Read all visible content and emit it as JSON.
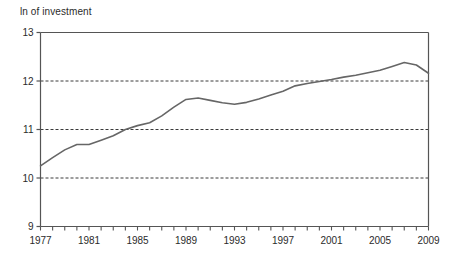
{
  "chart_data": {
    "type": "line",
    "title": "ln of investment",
    "xlabel": "",
    "ylabel": "",
    "ylim": [
      9,
      13
    ],
    "xlim": [
      1977,
      2009
    ],
    "y_ticks": [
      9,
      10,
      11,
      12,
      13
    ],
    "y_tick_labels": [
      "9",
      "10",
      "11",
      "12",
      "13"
    ],
    "x_ticks": [
      1977,
      1978,
      1979,
      1980,
      1981,
      1982,
      1983,
      1984,
      1985,
      1986,
      1987,
      1988,
      1989,
      1990,
      1991,
      1992,
      1993,
      1994,
      1995,
      1996,
      1997,
      1998,
      1999,
      2000,
      2001,
      2002,
      2003,
      2004,
      2005,
      2006,
      2007,
      2008,
      2009
    ],
    "x_tick_labels": [
      "1977",
      "1981",
      "1985",
      "1989",
      "1993",
      "1997",
      "2001",
      "2005",
      "2009"
    ],
    "x_tick_label_values": [
      1977,
      1981,
      1985,
      1989,
      1993,
      1997,
      2001,
      2005,
      2009
    ],
    "grid": "horizontal dashed at 10, 11, 12",
    "gridlines": [
      10,
      11,
      12
    ],
    "legend": "none",
    "line_color": "#666666",
    "series": [
      {
        "name": "ln of investment",
        "x": [
          1977,
          1978,
          1979,
          1980,
          1981,
          1982,
          1983,
          1984,
          1985,
          1986,
          1987,
          1988,
          1989,
          1990,
          1991,
          1992,
          1993,
          1994,
          1995,
          1996,
          1997,
          1998,
          1999,
          2000,
          2001,
          2002,
          2003,
          2004,
          2005,
          2006,
          2007,
          2008,
          2009
        ],
        "values": [
          10.25,
          10.42,
          10.58,
          10.69,
          10.69,
          10.78,
          10.87,
          11.0,
          11.08,
          11.14,
          11.28,
          11.46,
          11.62,
          11.65,
          11.6,
          11.55,
          11.52,
          11.56,
          11.63,
          11.71,
          11.79,
          11.9,
          11.95,
          11.99,
          12.03,
          12.08,
          12.12,
          12.17,
          12.22,
          12.3,
          12.38,
          12.33,
          12.16
        ]
      }
    ]
  },
  "axis": {
    "title": "ln of investment"
  }
}
